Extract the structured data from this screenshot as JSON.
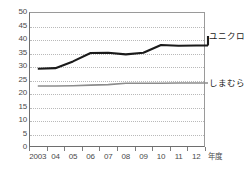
{
  "chart_data": {
    "type": "line",
    "title": "",
    "xlabel": "年度",
    "ylabel": "",
    "ylim": [
      0,
      50
    ],
    "ytick_step": 5,
    "grid": true,
    "legend_position": "right-inline",
    "categories": [
      "2003",
      "04",
      "05",
      "06",
      "07",
      "08",
      "09",
      "10",
      "11",
      "12"
    ],
    "yticks": [
      "50",
      "45",
      "40",
      "35",
      "30",
      "25",
      "20",
      "15",
      "10",
      "5",
      "0"
    ],
    "series": [
      {
        "name": "ユニクロ",
        "color": "#1a1a1a",
        "values": [
          29.0,
          29.2,
          31.7,
          34.8,
          34.9,
          34.3,
          34.9,
          37.8,
          37.5,
          37.6
        ]
      },
      {
        "name": "しまむら",
        "color": "#8c8c8c",
        "values": [
          22.6,
          22.6,
          22.7,
          22.9,
          23.1,
          23.6,
          23.6,
          23.6,
          23.7,
          23.7
        ]
      }
    ]
  },
  "axis": {
    "x_unit_label": "年度"
  }
}
